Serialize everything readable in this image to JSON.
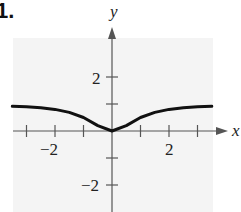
{
  "problem_number": "1.",
  "chart_data": {
    "type": "line",
    "title": "",
    "xlabel": "x",
    "ylabel": "y",
    "xlim": [
      -3.5,
      3.5
    ],
    "ylim": [
      -3,
      3
    ],
    "x_ticks": [
      -3,
      -2,
      -1,
      1,
      2,
      3
    ],
    "x_tick_labels": [
      "-2",
      "2"
    ],
    "y_ticks": [
      -2,
      -1,
      1,
      2
    ],
    "y_tick_labels": [
      "2",
      "-2"
    ],
    "grid": false,
    "series": [
      {
        "name": "f(x)",
        "x": [
          -3.5,
          -3,
          -2.5,
          -2,
          -1.5,
          -1,
          -0.5,
          0,
          0.5,
          1,
          1.5,
          2,
          2.5,
          3,
          3.5
        ],
        "values": [
          0.92,
          0.9,
          0.86,
          0.8,
          0.69,
          0.5,
          0.2,
          0,
          0.2,
          0.5,
          0.69,
          0.8,
          0.86,
          0.9,
          0.92
        ]
      }
    ]
  },
  "labels": {
    "x_axis": "x",
    "y_axis": "y",
    "x_tick_neg2": "−2",
    "x_tick_pos2": "2",
    "y_tick_pos2": "2",
    "y_tick_neg2": "−2"
  }
}
